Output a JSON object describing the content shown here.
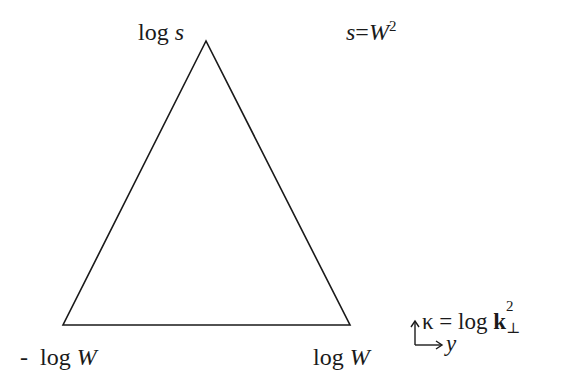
{
  "diagram": {
    "type": "triangle",
    "stroke_color": "#1a1a1a",
    "background": "#ffffff",
    "vertices": {
      "apex": {
        "x": 206,
        "y": 41
      },
      "base_left": {
        "x": 63,
        "y": 325
      },
      "base_right": {
        "x": 350,
        "y": 325
      }
    }
  },
  "labels": {
    "apex": {
      "log": "log",
      "var": "s"
    },
    "apex_condition": {
      "lhs": "s",
      "eq": "=",
      "rhs": "W",
      "exp": "2"
    },
    "base_left": {
      "prefix": "- ",
      "log": "log",
      "var": "W"
    },
    "base_right": {
      "log": "log",
      "var": "W"
    }
  },
  "axes_legend": {
    "vertical_label": {
      "kappa": "κ",
      "eq": " = ",
      "log": "log ",
      "k": "k",
      "exp": "2",
      "sub": "⊥"
    },
    "horizontal_label": "y"
  }
}
